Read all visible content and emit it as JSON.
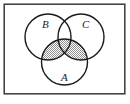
{
  "figure": {
    "type": "venn-diagram",
    "title": "",
    "frame": {
      "name": "border-rectangle",
      "x": 4,
      "y": 4,
      "width": 121,
      "height": 90,
      "stroke": "#3a3a3a",
      "stroke_width": 1.6,
      "fill": "#ffffff"
    },
    "background": "#ffffff",
    "circle_stroke": "#1a1a1a",
    "circle_stroke_width": 1.5,
    "circle_fill": "#ffffff",
    "shade_color": "#9a9a9a",
    "shade_pattern": "checker-hatch",
    "sets": [
      {
        "id": "B",
        "label": "B",
        "cx": 48,
        "cy": 37,
        "r": 23,
        "label_x": 43,
        "label_y": 24
      },
      {
        "id": "C",
        "label": "C",
        "cx": 81,
        "cy": 37,
        "r": 23,
        "label_x": 83,
        "label_y": 24
      },
      {
        "id": "A",
        "label": "A",
        "cx": 64.5,
        "cy": 62,
        "r": 23,
        "label_x": 62,
        "label_y": 79
      }
    ],
    "shaded_regions": [
      "A∩B",
      "A∩C",
      "A∩B∩C"
    ],
    "unshaded_regions": [
      "B only",
      "C only",
      "A only",
      "B∩C minus A"
    ],
    "label_font_size": 11
  }
}
